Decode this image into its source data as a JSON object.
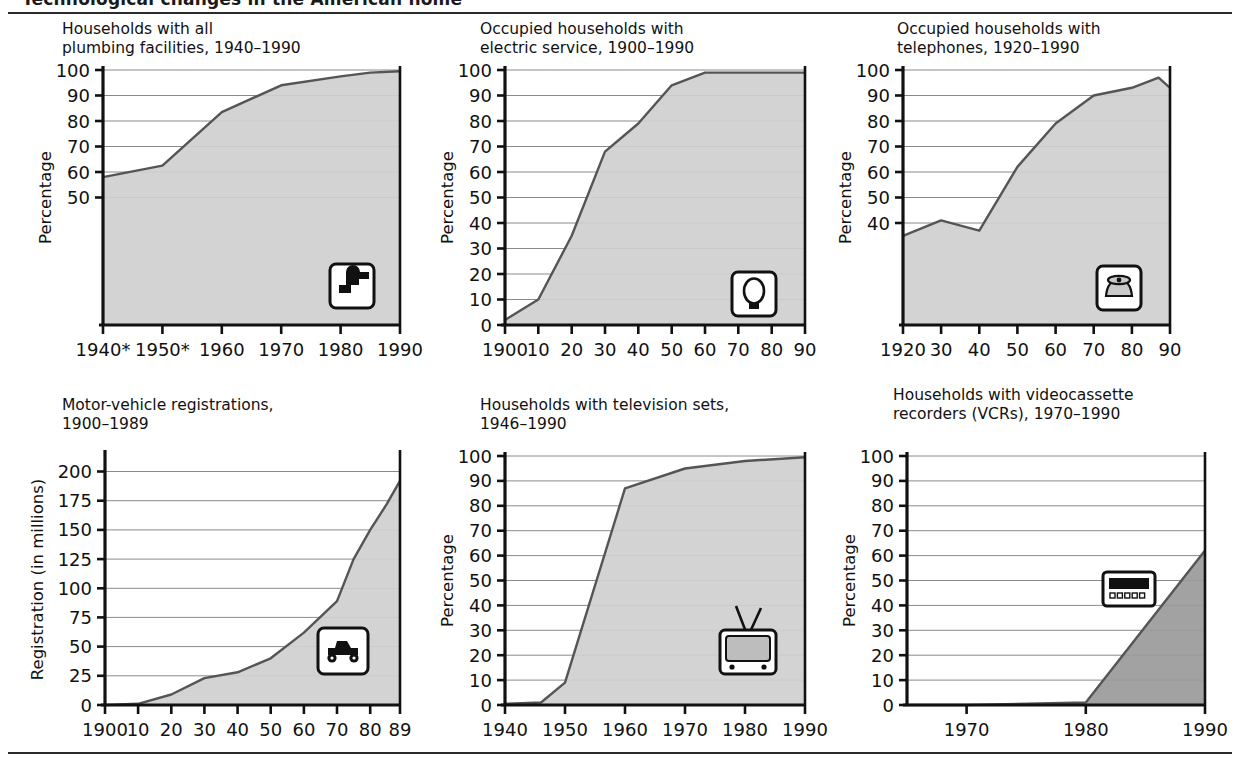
{
  "page": {
    "clipped_header_text": "Technological changes in the American home",
    "background": "#ffffff",
    "rule_color": "#2b2b2b",
    "area_fill": "#cfcfcf",
    "area_fill_dark": "#9a9a9a",
    "line_color": "#555555",
    "axis_color": "#111111",
    "grid_color": "#8a8a8a"
  },
  "charts": [
    {
      "id": "plumbing",
      "title": "Households with all\nplumbing facilities, 1940–1990",
      "icon": "faucet-icon",
      "ylabel": "Percentage",
      "xlabels": [
        "1940*",
        "1950*",
        "1960",
        "1970",
        "1980",
        "1990"
      ],
      "ylabels": [
        "100",
        "90",
        "80",
        "70",
        "60",
        "50"
      ]
    },
    {
      "id": "electric",
      "title": "Occupied households with\nelectric service, 1900–1990",
      "icon": "lightbulb-icon",
      "ylabel": "Percentage",
      "xlabels": [
        "1900",
        "10",
        "20",
        "30",
        "40",
        "50",
        "60",
        "70",
        "80",
        "90"
      ],
      "ylabels": [
        "100",
        "90",
        "80",
        "70",
        "60",
        "50",
        "40",
        "30",
        "20",
        "10",
        "0"
      ]
    },
    {
      "id": "telephones",
      "title": "Occupied households with\ntelephones, 1920–1990",
      "icon": "telephone-icon",
      "ylabel": "Percentage",
      "xlabels": [
        "1920",
        "30",
        "40",
        "50",
        "60",
        "70",
        "80",
        "90"
      ],
      "ylabels": [
        "100",
        "90",
        "80",
        "70",
        "60",
        "50",
        "40"
      ]
    },
    {
      "id": "motor-vehicles",
      "title": "Motor-vehicle registrations,\n1900–1989",
      "icon": "automobile-icon",
      "ylabel": "Registration (in millions)",
      "xlabels": [
        "1900",
        "10",
        "20",
        "30",
        "40",
        "50",
        "60",
        "70",
        "80",
        "89"
      ],
      "ylabels": [
        "200",
        "175",
        "150",
        "125",
        "100",
        "75",
        "50",
        "25",
        "0"
      ]
    },
    {
      "id": "television",
      "title": "Households with television sets,\n1946–1990",
      "icon": "television-icon",
      "ylabel": "Percentage",
      "xlabels": [
        "1940",
        "1950",
        "1960",
        "1970",
        "1980",
        "1990"
      ],
      "ylabels": [
        "100",
        "90",
        "80",
        "70",
        "60",
        "50",
        "40",
        "30",
        "20",
        "10",
        "0"
      ]
    },
    {
      "id": "vcr",
      "title": "Households with videocassette\nrecorders (VCRs), 1970–1990",
      "icon": "vcr-icon",
      "ylabel": "Percentage",
      "xlabels": [
        "1970",
        "1980",
        "1990"
      ],
      "ylabels": [
        "100",
        "90",
        "80",
        "70",
        "60",
        "50",
        "40",
        "30",
        "20",
        "10",
        "0"
      ]
    }
  ],
  "chart_data": [
    {
      "type": "area",
      "id": "plumbing",
      "title": "Households with all plumbing facilities, 1940–1990",
      "xlabel": "",
      "ylabel": "Percentage",
      "xlim": [
        1940,
        1990
      ],
      "ylim": [
        0,
        100
      ],
      "yticks": [
        50,
        60,
        70,
        80,
        90,
        100
      ],
      "xticks": [
        1940,
        1950,
        1960,
        1970,
        1980,
        1990
      ],
      "xticklabels": [
        "1940*",
        "1950*",
        "1960",
        "1970",
        "1980",
        "1990"
      ],
      "grid": "horizontal",
      "x": [
        1940,
        1950,
        1960,
        1970,
        1980,
        1985,
        1990
      ],
      "values": [
        58,
        62.5,
        83.5,
        94,
        97.5,
        99,
        99.5
      ],
      "note": "* asterisk on 1940 and 1950 tick labels"
    },
    {
      "type": "area",
      "id": "electric",
      "title": "Occupied households with electric service, 1900–1990",
      "xlabel": "",
      "ylabel": "Percentage",
      "xlim": [
        1900,
        1990
      ],
      "ylim": [
        0,
        100
      ],
      "yticks": [
        0,
        10,
        20,
        30,
        40,
        50,
        60,
        70,
        80,
        90,
        100
      ],
      "xticks": [
        1900,
        1910,
        1920,
        1930,
        1940,
        1950,
        1960,
        1970,
        1980,
        1990
      ],
      "xticklabels": [
        "1900",
        "10",
        "20",
        "30",
        "40",
        "50",
        "60",
        "70",
        "80",
        "90"
      ],
      "grid": "horizontal",
      "x": [
        1900,
        1910,
        1920,
        1930,
        1940,
        1950,
        1960,
        1970,
        1980,
        1990
      ],
      "values": [
        2,
        10,
        35,
        68,
        79,
        94,
        99,
        99,
        99,
        99
      ]
    },
    {
      "type": "area",
      "id": "telephones",
      "title": "Occupied households with telephones, 1920–1990",
      "xlabel": "",
      "ylabel": "Percentage",
      "xlim": [
        1920,
        1990
      ],
      "ylim": [
        0,
        100
      ],
      "yticks": [
        40,
        50,
        60,
        70,
        80,
        90,
        100
      ],
      "xticks": [
        1920,
        1930,
        1940,
        1950,
        1960,
        1970,
        1980,
        1990
      ],
      "xticklabels": [
        "1920",
        "30",
        "40",
        "50",
        "60",
        "70",
        "80",
        "90"
      ],
      "grid": "horizontal",
      "x": [
        1920,
        1930,
        1940,
        1950,
        1960,
        1970,
        1980,
        1987,
        1990
      ],
      "values": [
        35,
        41,
        37,
        62,
        79,
        90,
        93,
        97,
        93
      ]
    },
    {
      "type": "area",
      "id": "motor-vehicles",
      "title": "Motor-vehicle registrations, 1900–1989",
      "xlabel": "",
      "ylabel": "Registration (in millions)",
      "xlim": [
        1900,
        1989
      ],
      "ylim": [
        0,
        215
      ],
      "yticks": [
        0,
        25,
        50,
        75,
        100,
        125,
        150,
        175,
        200
      ],
      "xticks": [
        1900,
        1910,
        1920,
        1930,
        1940,
        1950,
        1960,
        1970,
        1980,
        1989
      ],
      "xticklabels": [
        "1900",
        "10",
        "20",
        "30",
        "40",
        "50",
        "60",
        "70",
        "80",
        "89"
      ],
      "grid": "horizontal",
      "x": [
        1900,
        1910,
        1920,
        1930,
        1940,
        1950,
        1960,
        1970,
        1975,
        1980,
        1985,
        1989
      ],
      "values": [
        0,
        1,
        9,
        23,
        28,
        40,
        62,
        89,
        125,
        150,
        172,
        192
      ]
    },
    {
      "type": "area",
      "id": "television",
      "title": "Households with television sets, 1946–1990",
      "xlabel": "",
      "ylabel": "Percentage",
      "xlim": [
        1940,
        1990
      ],
      "ylim": [
        0,
        100
      ],
      "yticks": [
        0,
        10,
        20,
        30,
        40,
        50,
        60,
        70,
        80,
        90,
        100
      ],
      "xticks": [
        1940,
        1950,
        1960,
        1970,
        1980,
        1990
      ],
      "xticklabels": [
        "1940",
        "1950",
        "1960",
        "1970",
        "1980",
        "1990"
      ],
      "grid": "horizontal",
      "x": [
        1940,
        1946,
        1950,
        1960,
        1970,
        1980,
        1990
      ],
      "values": [
        0.5,
        1,
        9,
        87,
        95,
        98,
        99.5
      ]
    },
    {
      "type": "area",
      "id": "vcr",
      "title": "Households with videocassette recorders (VCRs), 1970–1990",
      "xlabel": "",
      "ylabel": "Percentage",
      "xlim": [
        1965,
        1990
      ],
      "ylim": [
        0,
        100
      ],
      "yticks": [
        0,
        10,
        20,
        30,
        40,
        50,
        60,
        70,
        80,
        90,
        100
      ],
      "xticks": [
        1970,
        1980,
        1990
      ],
      "xticklabels": [
        "1970",
        "1980",
        "1990"
      ],
      "grid": "horizontal",
      "x": [
        1965,
        1970,
        1980,
        1990
      ],
      "values": [
        0,
        0,
        1,
        62
      ]
    }
  ]
}
